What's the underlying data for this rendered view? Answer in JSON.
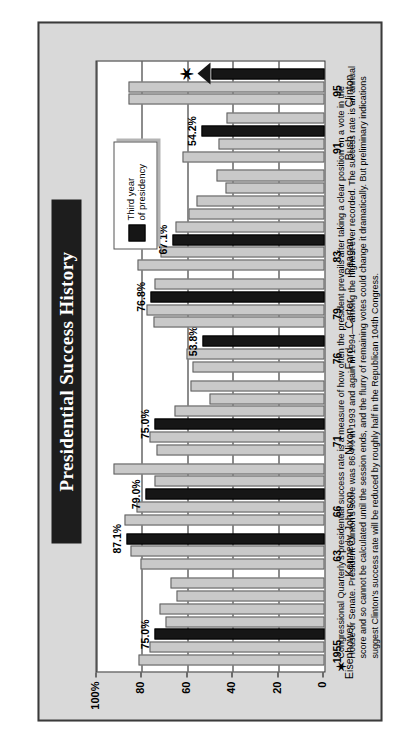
{
  "title": "Presidential Success History",
  "legend": {
    "swatch_label_line1": "Third year",
    "swatch_label_line2": "of presidency",
    "swatch_color": "#161616"
  },
  "footnote": {
    "marker": "✶",
    "text": "Congressional Quarterly's presidential success rate is a measure of how often the president prevails after taking a clear position on a vote in the House or Senate. President Clinton's score was 86.4% in 1993 and again in 1994— among the highest ever recorded. The success rate is an annual score and so cannot be calculated until the session ends, and the flurry of remaining votes could change it dramatically. But preliminary indications suggest Clinton's success rate will be reduced by roughly half in the Republican 104th Congress."
  },
  "colors": {
    "panel_background": "#d9d9d9",
    "plot_background": "#ffffff",
    "bar_normal": "#c9c9c9",
    "bar_third_year": "#161616",
    "title_plate": "#1d1d1d",
    "title_text": "#ffffff"
  },
  "chart_data": {
    "type": "bar",
    "title": "Presidential Success History",
    "xlabel": "",
    "ylabel": "",
    "ylim": [
      0,
      100
    ],
    "yticks": [
      0,
      20,
      40,
      60,
      80,
      100
    ],
    "ytick_labels": [
      "0",
      "20",
      "40",
      "60",
      "80",
      "100%"
    ],
    "grid": true,
    "legend_position": "upper-right-inside",
    "orientation": "horizontal",
    "presidents": [
      {
        "name": "Eisenhower",
        "start_year_label": "1955",
        "values": [
          82.0,
          77.0,
          75.0,
          70.0,
          72.5,
          65.0,
          68.0
        ],
        "third_year_index": 2,
        "third_year_value": 75.0,
        "third_year_label": "75.0%"
      },
      {
        "name": "Kennedy",
        "start_year_label": "63",
        "values": [
          81.0,
          85.4,
          87.1
        ],
        "third_year_index": 2,
        "third_year_value": 87.1,
        "third_year_label": "87.1%"
      },
      {
        "name": "Johnson",
        "start_year_label": "66",
        "values": [
          88.0,
          83.0,
          79.0,
          75.0,
          93.0
        ],
        "third_year_index": 2,
        "third_year_value": 79.0,
        "third_year_label": "79.0%"
      },
      {
        "name": "Nixon",
        "start_year_label": "71",
        "values": [
          74.0,
          77.0,
          75.0,
          66.0,
          50.6,
          59.0
        ],
        "third_year_index": 2,
        "third_year_value": 75.0,
        "third_year_label": "75.0%"
      },
      {
        "name": "Ford",
        "start_year_label": "76",
        "values": [
          58.2,
          61.0,
          53.8
        ],
        "third_year_index": 2,
        "third_year_value": 53.8,
        "third_year_label": "53.8%"
      },
      {
        "name": "Carter",
        "start_year_label": "79",
        "values": [
          75.4,
          78.3,
          76.8,
          75.1
        ],
        "third_year_index": 2,
        "third_year_value": 76.8,
        "third_year_label": "76.8%"
      },
      {
        "name": "Reagan",
        "start_year_label": "83",
        "values": [
          82.4,
          72.4,
          67.1,
          65.8,
          59.9,
          56.5,
          43.5,
          47.4
        ],
        "third_year_index": 2,
        "third_year_value": 67.1,
        "third_year_label": "67.1%"
      },
      {
        "name": "Bush",
        "start_year_label": "91",
        "values": [
          62.6,
          46.8,
          54.2,
          43.0
        ],
        "third_year_index": 2,
        "third_year_value": 54.2,
        "third_year_label": "54.2%"
      },
      {
        "name": "Clinton",
        "start_year_label": "95",
        "values": [
          86.4,
          86.4
        ],
        "third_year_index": -1,
        "in_progress_value": 50.0,
        "in_progress_note": "third year in progress — arrow"
      }
    ]
  }
}
